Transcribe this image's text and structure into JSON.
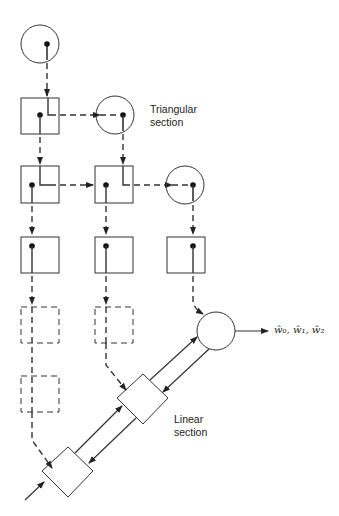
{
  "diagram": {
    "labels": {
      "triangular": [
        "Triangular",
        "section"
      ],
      "linear": [
        "Linear",
        "section"
      ],
      "output": "ŵ₀, ŵ₁, ŵ₂"
    },
    "colors": {
      "stroke": "#333333",
      "background": "#ffffff"
    },
    "nodes": {
      "boundary_cells": [
        "circle-1",
        "circle-2",
        "circle-3"
      ],
      "internal_cells_solid": 6,
      "internal_cells_dashed": 3,
      "final_cell": "circle-output",
      "linear_cells": 2
    }
  }
}
